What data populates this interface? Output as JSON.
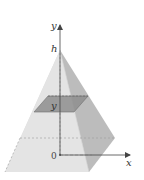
{
  "figure": {
    "type": "pyramid-cross-section",
    "labels": {
      "y_axis": "y",
      "x_axis": "x",
      "apex": "h",
      "origin": "0",
      "section_height": "y"
    },
    "colors": {
      "front_face": "#e3e3e3",
      "right_face": "#bdbdbd",
      "left_face": "#d6d6d6",
      "cross_section": "#8f8f8f",
      "axis": "#444444",
      "dashed": "#777777",
      "background": "#ffffff"
    }
  }
}
